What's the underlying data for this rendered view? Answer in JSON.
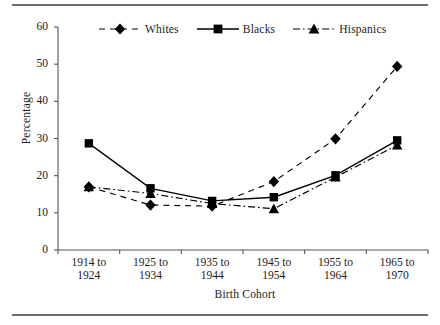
{
  "figure": {
    "rules": [
      "top-rule",
      "bottom-rule"
    ]
  },
  "chart_data": {
    "type": "line",
    "title": "",
    "xlabel": "Birth Cohort",
    "ylabel": "Percentage",
    "ylim": [
      0,
      60
    ],
    "yticks": [
      0,
      10,
      20,
      30,
      40,
      50,
      60
    ],
    "ytick_labels": [
      "0",
      "10",
      "20",
      "30",
      "40",
      "50",
      "60"
    ],
    "grid": false,
    "legend_position": "top-center",
    "categories": [
      "1914 to\n1924",
      "1925 to\n1934",
      "1935 to\n1944",
      "1945 to\n1954",
      "1955 to\n1964",
      "1965 to\n1970"
    ],
    "category_lines": [
      [
        "1914 to",
        "1924"
      ],
      [
        "1925 to",
        "1934"
      ],
      [
        "1935 to",
        "1944"
      ],
      [
        "1945 to",
        "1954"
      ],
      [
        "1955 to",
        "1964"
      ],
      [
        "1965 to",
        "1970"
      ]
    ],
    "series": [
      {
        "name": "Whites",
        "marker": "diamond",
        "linestyle": "dashed",
        "color": "#000000",
        "values": [
          17.0,
          12.1,
          11.8,
          18.4,
          29.9,
          49.4
        ]
      },
      {
        "name": "Blacks",
        "marker": "square",
        "linestyle": "solid",
        "color": "#000000",
        "values": [
          28.7,
          16.6,
          13.2,
          14.2,
          20.1,
          29.5
        ]
      },
      {
        "name": "Hispanics",
        "marker": "triangle",
        "linestyle": "dashdot",
        "color": "#000000",
        "values": [
          17.0,
          15.2,
          12.5,
          11.1,
          19.6,
          28.2
        ]
      }
    ]
  }
}
